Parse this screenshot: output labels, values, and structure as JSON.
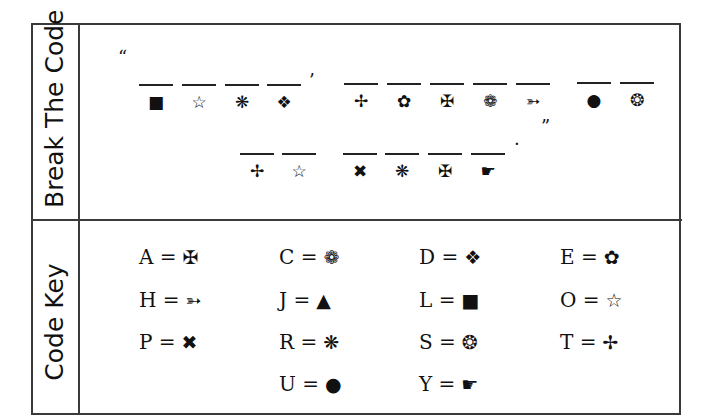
{
  "sections": {
    "puzzle_label": "Break The Code",
    "key_label": "Code Key"
  },
  "puzzle": {
    "open_quote": "“",
    "apostrophe": "’",
    "period": ".",
    "close_quote": "”",
    "row1": [
      {
        "icon": "black-square-icon",
        "glyph": "■"
      },
      {
        "icon": "outline-star-icon",
        "glyph": "☆"
      },
      {
        "icon": "asterisk-icon",
        "glyph": "❋"
      },
      {
        "icon": "diamond-cluster-icon",
        "glyph": "❖"
      },
      {
        "icon": "four-point-cross-icon",
        "glyph": "✢"
      },
      {
        "icon": "five-petal-flower-icon",
        "glyph": "✿"
      },
      {
        "icon": "maltese-cross-icon",
        "glyph": "✠"
      },
      {
        "icon": "eight-petal-flower-icon",
        "glyph": "❁"
      },
      {
        "icon": "pointer-shape-icon",
        "glyph": "➳"
      },
      {
        "icon": "black-circle-icon",
        "glyph": "●"
      },
      {
        "icon": "ring-icon",
        "glyph": "❂"
      }
    ],
    "row2": [
      {
        "icon": "four-point-cross-icon",
        "glyph": "✢"
      },
      {
        "icon": "outline-star-icon",
        "glyph": "☆"
      },
      {
        "icon": "heavy-x-icon",
        "glyph": "✖"
      },
      {
        "icon": "asterisk-icon",
        "glyph": "❋"
      },
      {
        "icon": "maltese-cross-icon",
        "glyph": "✠"
      },
      {
        "icon": "pointing-hand-icon",
        "glyph": "☛"
      }
    ]
  },
  "code_key": [
    {
      "letter": "A",
      "eq": "=",
      "glyph": "✠",
      "icon": "maltese-cross-icon"
    },
    {
      "letter": "C",
      "eq": "=",
      "glyph": "❁",
      "icon": "eight-petal-flower-icon"
    },
    {
      "letter": "D",
      "eq": "=",
      "glyph": "❖",
      "icon": "diamond-cluster-icon"
    },
    {
      "letter": "E",
      "eq": "=",
      "glyph": "✿",
      "icon": "five-petal-flower-icon"
    },
    {
      "letter": "H",
      "eq": "=",
      "glyph": "➳",
      "icon": "pointer-shape-icon"
    },
    {
      "letter": "J",
      "eq": "=",
      "glyph": "▲",
      "icon": "black-triangle-icon"
    },
    {
      "letter": "L",
      "eq": "=",
      "glyph": "■",
      "icon": "black-square-icon"
    },
    {
      "letter": "O",
      "eq": "=",
      "glyph": "☆",
      "icon": "outline-star-icon"
    },
    {
      "letter": "P",
      "eq": "=",
      "glyph": "✖",
      "icon": "heavy-x-icon"
    },
    {
      "letter": "R",
      "eq": "=",
      "glyph": "❋",
      "icon": "asterisk-icon"
    },
    {
      "letter": "S",
      "eq": "=",
      "glyph": "❂",
      "icon": "ring-icon"
    },
    {
      "letter": "T",
      "eq": "=",
      "glyph": "✢",
      "icon": "four-point-cross-icon"
    },
    {
      "letter": "U",
      "eq": "=",
      "glyph": "●",
      "icon": "black-circle-icon"
    },
    {
      "letter": "Y",
      "eq": "=",
      "glyph": "☛",
      "icon": "pointing-hand-icon"
    }
  ]
}
